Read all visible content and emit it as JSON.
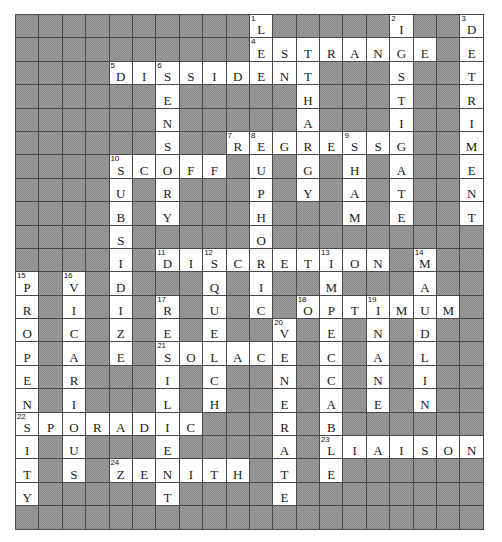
{
  "puzzle": {
    "kind": "crossword-solution-grid",
    "columns": 20,
    "rows": 22,
    "cell_size_px": 23.4,
    "colors": {
      "block_fill": "#9d9d9d",
      "open_fill": "#ffffff",
      "grid_line": "#4a4a4a",
      "letter_color": "#1a1a1a",
      "number_color": "#111111"
    },
    "grid": [
      "..........L.....I..D",
      "..........ESTRANGE.E",
      "....DISSIDENT...S..T",
      "......E...H.....T..R",
      "......N...A.....I..I",
      "......S.RE GRESS.G..M",
      "....SCOFF.U.G.H.A..E",
      "....U.R...P.Y.A.T..N",
      "....B.Y...H...M.E..T",
      "....S.....O.........",
      "....I.DISCRETION.M..",
      "P.V.D...Q.I.M...A...",
      "R.I.I.R.U.C.OPTIMUM.",
      "O.C.Z.E.E.,V.E.N.D...",
      "P.A.E.SOLACE.C.A.L..",
      "E.R...I.C...N.C.N.I.",
      "N.I...L.H...E.A.E.N.",
      "SPORADIC....R.B.....",
      "I.U...E.....A.LIAISON",
      "T.S.ZENITH..T.E.....",
      "Y.....T.....E......."
    ],
    "rows_data": [
      {
        "r": 0,
        "cells": [
          {
            "c": 10,
            "letter": "L",
            "num": "1"
          },
          {
            "c": 16,
            "letter": "I",
            "num": "2"
          },
          {
            "c": 19,
            "letter": "D",
            "num": "3"
          }
        ]
      },
      {
        "r": 1,
        "cells": [
          {
            "c": 10,
            "letter": "E",
            "num": "4"
          },
          {
            "c": 11,
            "letter": "S"
          },
          {
            "c": 12,
            "letter": "T"
          },
          {
            "c": 13,
            "letter": "R"
          },
          {
            "c": 14,
            "letter": "A"
          },
          {
            "c": 15,
            "letter": "N"
          },
          {
            "c": 16,
            "letter": "G"
          },
          {
            "c": 17,
            "letter": "E"
          },
          {
            "c": 19,
            "letter": "E"
          }
        ]
      },
      {
        "r": 2,
        "cells": [
          {
            "c": 4,
            "letter": "D",
            "num": "5"
          },
          {
            "c": 5,
            "letter": "I"
          },
          {
            "c": 6,
            "letter": "S",
            "num": "6"
          },
          {
            "c": 7,
            "letter": "S"
          },
          {
            "c": 8,
            "letter": "I"
          },
          {
            "c": 9,
            "letter": "D"
          },
          {
            "c": 10,
            "letter": "E"
          },
          {
            "c": 11,
            "letter": "N"
          },
          {
            "c": 12,
            "letter": "T"
          },
          {
            "c": 16,
            "letter": "S"
          },
          {
            "c": 19,
            "letter": "T"
          }
        ]
      },
      {
        "r": 3,
        "cells": [
          {
            "c": 6,
            "letter": "E"
          },
          {
            "c": 12,
            "letter": "H"
          },
          {
            "c": 16,
            "letter": "T"
          },
          {
            "c": 19,
            "letter": "R"
          }
        ]
      },
      {
        "r": 4,
        "cells": [
          {
            "c": 6,
            "letter": "N"
          },
          {
            "c": 12,
            "letter": "A"
          },
          {
            "c": 16,
            "letter": "I"
          },
          {
            "c": 19,
            "letter": "I"
          }
        ]
      },
      {
        "r": 5,
        "cells": [
          {
            "c": 6,
            "letter": "S"
          },
          {
            "c": 9,
            "letter": "R",
            "num": "7"
          },
          {
            "c": 10,
            "letter": "E",
            "num": "8"
          },
          {
            "c": 11,
            "letter": "G"
          },
          {
            "c": 12,
            "letter": "R"
          },
          {
            "c": 13,
            "letter": "E"
          },
          {
            "c": 14,
            "letter": "S",
            "num": "9"
          },
          {
            "c": 15,
            "letter": "S"
          },
          {
            "c": 16,
            "letter": "G"
          },
          {
            "c": 19,
            "letter": "M"
          }
        ]
      },
      {
        "r": 6,
        "cells": [
          {
            "c": 4,
            "letter": "S",
            "num": "10"
          },
          {
            "c": 5,
            "letter": "C"
          },
          {
            "c": 6,
            "letter": "O"
          },
          {
            "c": 7,
            "letter": "F"
          },
          {
            "c": 8,
            "letter": "F"
          },
          {
            "c": 10,
            "letter": "U"
          },
          {
            "c": 12,
            "letter": "G"
          },
          {
            "c": 14,
            "letter": "H"
          },
          {
            "c": 16,
            "letter": "A"
          },
          {
            "c": 19,
            "letter": "E"
          }
        ]
      },
      {
        "r": 7,
        "cells": [
          {
            "c": 4,
            "letter": "U"
          },
          {
            "c": 6,
            "letter": "R"
          },
          {
            "c": 10,
            "letter": "P"
          },
          {
            "c": 12,
            "letter": "Y"
          },
          {
            "c": 14,
            "letter": "A"
          },
          {
            "c": 16,
            "letter": "T"
          },
          {
            "c": 19,
            "letter": "N"
          }
        ]
      },
      {
        "r": 8,
        "cells": [
          {
            "c": 4,
            "letter": "B"
          },
          {
            "c": 6,
            "letter": "Y"
          },
          {
            "c": 10,
            "letter": "H"
          },
          {
            "c": 14,
            "letter": "M"
          },
          {
            "c": 16,
            "letter": "E"
          },
          {
            "c": 19,
            "letter": "T"
          }
        ]
      },
      {
        "r": 9,
        "cells": [
          {
            "c": 4,
            "letter": "S"
          },
          {
            "c": 10,
            "letter": "O"
          }
        ]
      },
      {
        "r": 10,
        "cells": [
          {
            "c": 4,
            "letter": "I"
          },
          {
            "c": 6,
            "letter": "D",
            "num": "11"
          },
          {
            "c": 7,
            "letter": "I"
          },
          {
            "c": 8,
            "letter": "S",
            "num": "12"
          },
          {
            "c": 9,
            "letter": "C"
          },
          {
            "c": 10,
            "letter": "R"
          },
          {
            "c": 11,
            "letter": "E"
          },
          {
            "c": 12,
            "letter": "T"
          },
          {
            "c": 13,
            "letter": "I",
            "num": "13"
          },
          {
            "c": 14,
            "letter": "O"
          },
          {
            "c": 15,
            "letter": "N"
          },
          {
            "c": 17,
            "letter": "M",
            "num": "14"
          }
        ]
      },
      {
        "r": 11,
        "cells": [
          {
            "c": 0,
            "letter": "P",
            "num": "15"
          },
          {
            "c": 2,
            "letter": "V",
            "num": "16"
          },
          {
            "c": 4,
            "letter": "D"
          },
          {
            "c": 8,
            "letter": "Q"
          },
          {
            "c": 10,
            "letter": "I"
          },
          {
            "c": 13,
            "letter": "M"
          },
          {
            "c": 17,
            "letter": "A"
          }
        ]
      },
      {
        "r": 12,
        "cells": [
          {
            "c": 0,
            "letter": "R"
          },
          {
            "c": 2,
            "letter": "I"
          },
          {
            "c": 4,
            "letter": "I"
          },
          {
            "c": 6,
            "letter": "R",
            "num": "17"
          },
          {
            "c": 8,
            "letter": "U"
          },
          {
            "c": 10,
            "letter": "C"
          },
          {
            "c": 12,
            "letter": "O",
            "num": "18"
          },
          {
            "c": 13,
            "letter": "P"
          },
          {
            "c": 14,
            "letter": "T"
          },
          {
            "c": 15,
            "letter": "I",
            "num": "19"
          },
          {
            "c": 16,
            "letter": "M"
          },
          {
            "c": 17,
            "letter": "U"
          },
          {
            "c": 18,
            "letter": "M"
          }
        ]
      },
      {
        "r": 13,
        "cells": [
          {
            "c": 0,
            "letter": "O"
          },
          {
            "c": 2,
            "letter": "C"
          },
          {
            "c": 4,
            "letter": "Z"
          },
          {
            "c": 6,
            "letter": "E"
          },
          {
            "c": 8,
            "letter": "E"
          },
          {
            "c": 11,
            "letter": "V",
            "num": "20"
          },
          {
            "c": 13,
            "letter": "E"
          },
          {
            "c": 15,
            "letter": "N"
          },
          {
            "c": 17,
            "letter": "D"
          }
        ]
      },
      {
        "r": 14,
        "cells": [
          {
            "c": 0,
            "letter": "P"
          },
          {
            "c": 2,
            "letter": "A"
          },
          {
            "c": 4,
            "letter": "E"
          },
          {
            "c": 6,
            "letter": "S",
            "num": "21"
          },
          {
            "c": 7,
            "letter": "O"
          },
          {
            "c": 8,
            "letter": "L"
          },
          {
            "c": 9,
            "letter": "A"
          },
          {
            "c": 10,
            "letter": "C"
          },
          {
            "c": 11,
            "letter": "E"
          },
          {
            "c": 13,
            "letter": "C"
          },
          {
            "c": 15,
            "letter": "A"
          },
          {
            "c": 17,
            "letter": "L"
          }
        ]
      },
      {
        "r": 15,
        "cells": [
          {
            "c": 0,
            "letter": "E"
          },
          {
            "c": 2,
            "letter": "R"
          },
          {
            "c": 6,
            "letter": "I"
          },
          {
            "c": 8,
            "letter": "C"
          },
          {
            "c": 11,
            "letter": "N"
          },
          {
            "c": 13,
            "letter": "C"
          },
          {
            "c": 15,
            "letter": "N"
          },
          {
            "c": 17,
            "letter": "I"
          }
        ]
      },
      {
        "r": 16,
        "cells": [
          {
            "c": 0,
            "letter": "N"
          },
          {
            "c": 2,
            "letter": "I"
          },
          {
            "c": 6,
            "letter": "L"
          },
          {
            "c": 8,
            "letter": "H"
          },
          {
            "c": 11,
            "letter": "E"
          },
          {
            "c": 13,
            "letter": "A"
          },
          {
            "c": 15,
            "letter": "E"
          },
          {
            "c": 17,
            "letter": "N"
          }
        ]
      },
      {
        "r": 17,
        "cells": [
          {
            "c": 0,
            "letter": "S",
            "num": "22"
          },
          {
            "c": 1,
            "letter": "P"
          },
          {
            "c": 2,
            "letter": "O"
          },
          {
            "c": 3,
            "letter": "R"
          },
          {
            "c": 4,
            "letter": "A"
          },
          {
            "c": 5,
            "letter": "D"
          },
          {
            "c": 6,
            "letter": "I"
          },
          {
            "c": 7,
            "letter": "C"
          },
          {
            "c": 11,
            "letter": "R"
          },
          {
            "c": 13,
            "letter": "B"
          }
        ]
      },
      {
        "r": 18,
        "cells": [
          {
            "c": 0,
            "letter": "I"
          },
          {
            "c": 2,
            "letter": "U"
          },
          {
            "c": 6,
            "letter": "E"
          },
          {
            "c": 11,
            "letter": "A"
          },
          {
            "c": 13,
            "letter": "L",
            "num": "23"
          },
          {
            "c": 14,
            "letter": "I"
          },
          {
            "c": 15,
            "letter": "A"
          },
          {
            "c": 16,
            "letter": "I"
          },
          {
            "c": 17,
            "letter": "S"
          },
          {
            "c": 18,
            "letter": "O"
          },
          {
            "c": 19,
            "letter": "N"
          }
        ]
      },
      {
        "r": 19,
        "cells": [
          {
            "c": 0,
            "letter": "T"
          },
          {
            "c": 2,
            "letter": "S"
          },
          {
            "c": 4,
            "letter": "Z",
            "num": "24"
          },
          {
            "c": 5,
            "letter": "E"
          },
          {
            "c": 6,
            "letter": "N"
          },
          {
            "c": 7,
            "letter": "I"
          },
          {
            "c": 8,
            "letter": "T"
          },
          {
            "c": 9,
            "letter": "H"
          },
          {
            "c": 11,
            "letter": "T"
          },
          {
            "c": 13,
            "letter": "E"
          }
        ]
      },
      {
        "r": 20,
        "cells": [
          {
            "c": 0,
            "letter": "Y"
          },
          {
            "c": 6,
            "letter": "T"
          },
          {
            "c": 11,
            "letter": "E"
          }
        ]
      },
      {
        "r": 21,
        "cells": []
      }
    ],
    "answers_across": [
      {
        "num": "4",
        "answer": "ESTRANGE"
      },
      {
        "num": "5",
        "answer": "DISSIDENT"
      },
      {
        "num": "7",
        "answer": "REGRESS"
      },
      {
        "num": "10",
        "answer": "SCOFF"
      },
      {
        "num": "11",
        "answer": "DISCRETION"
      },
      {
        "num": "18",
        "answer": "OPTIMUM"
      },
      {
        "num": "21",
        "answer": "SOLACE"
      },
      {
        "num": "22",
        "answer": "SPORADIC"
      },
      {
        "num": "23",
        "answer": "LIAISON"
      },
      {
        "num": "24",
        "answer": "ZENITH"
      }
    ],
    "answers_down": [
      {
        "num": "1",
        "answer": "LETHARGY"
      },
      {
        "num": "2",
        "answer": "INSTIGATE"
      },
      {
        "num": "3",
        "answer": "DETRIMENT"
      },
      {
        "num": "6",
        "answer": "SENSIBILITY"
      },
      {
        "num": "8",
        "answer": "EUPHORIA"
      },
      {
        "num": "9",
        "answer": "SHAME"
      },
      {
        "num": "12",
        "answer": "SQUEEZE"
      },
      {
        "num": "13",
        "answer": "IM"
      },
      {
        "num": "14",
        "answer": "MADLINE"
      },
      {
        "num": "15",
        "answer": "PROPENSITY"
      },
      {
        "num": "16",
        "answer": "VICARIOUS"
      },
      {
        "num": "17",
        "answer": "REVERSE"
      },
      {
        "num": "19",
        "answer": "IMPEDE"
      },
      {
        "num": "20",
        "answer": "VENERABLE"
      }
    ]
  }
}
